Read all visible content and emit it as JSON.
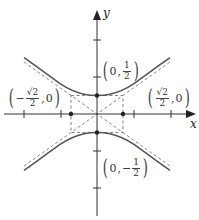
{
  "diagram": {
    "type": "hyperbola",
    "equation": "2y^2 - x^2... with vertices (0, ±1/2) and foci-like points (±√2/2, 0)",
    "axes": {
      "x_label": "x",
      "y_label": "y"
    },
    "labels": {
      "top_vertex": {
        "open": "(",
        "x": "0",
        "sep": ",",
        "num": "1",
        "den": "2",
        "sign": "",
        "close": ")"
      },
      "bottom_vertex": {
        "open": "(",
        "x": "0",
        "sep": ",",
        "num": "1",
        "den": "2",
        "sign": "−",
        "close": ")"
      },
      "left_point": {
        "open": "(",
        "sign": "−",
        "num": "√2",
        "den": "2",
        "sep": ",",
        "y": "0",
        "close": ")"
      },
      "right_point": {
        "open": "(",
        "sign": "",
        "num": "√2",
        "den": "2",
        "sep": ",",
        "y": "0",
        "close": ")"
      }
    },
    "colors": {
      "curve": "#555555",
      "axis": "#333333",
      "dashed": "#777777",
      "label": "#333333"
    }
  }
}
